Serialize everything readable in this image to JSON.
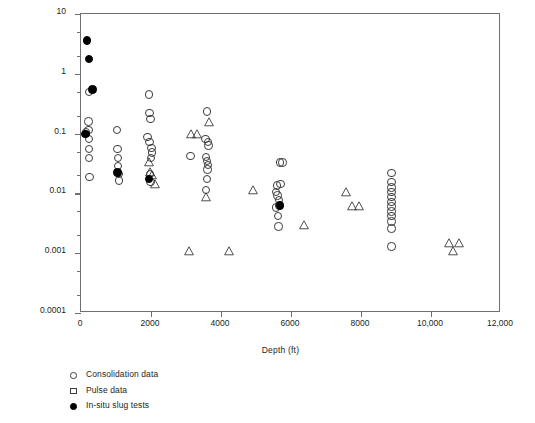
{
  "chart_data": {
    "type": "scatter",
    "title": "",
    "xlabel": "Depth (ft)",
    "ylabel": "Permeability (md)",
    "xlim": [
      0,
      12000
    ],
    "ylim": [
      0.0001,
      10
    ],
    "yscale": "log",
    "xscale": "linear",
    "grid": false,
    "legend_position": "below-left",
    "xticks": [
      0,
      2000,
      4000,
      6000,
      8000,
      10000,
      12000
    ],
    "xticklabels": [
      "0",
      "2000",
      "4000",
      "6000",
      "8000",
      "10,000",
      "12,000"
    ],
    "yticks": [
      0.0001,
      0.001,
      0.01,
      0.1,
      1,
      10
    ],
    "yticklabels": [
      "0.0001",
      "0.001",
      "0.01",
      "0.1",
      "1",
      "10"
    ],
    "series": [
      {
        "name": "Consolidation data",
        "marker": "circle-open",
        "points": [
          [
            230,
            0.5
          ],
          [
            150,
            0.105
          ],
          [
            210,
            0.16
          ],
          [
            215,
            0.115
          ],
          [
            225,
            0.082
          ],
          [
            230,
            0.055
          ],
          [
            235,
            0.039
          ],
          [
            245,
            0.019
          ],
          [
            1030,
            0.115
          ],
          [
            1040,
            0.055
          ],
          [
            1050,
            0.039
          ],
          [
            1060,
            0.029
          ],
          [
            1080,
            0.021
          ],
          [
            1080,
            0.0165
          ],
          [
            1950,
            0.45
          ],
          [
            1960,
            0.22
          ],
          [
            1990,
            0.175
          ],
          [
            1900,
            0.088
          ],
          [
            1960,
            0.072
          ],
          [
            2010,
            0.057
          ],
          [
            2030,
            0.048
          ],
          [
            2000,
            0.039
          ],
          [
            1980,
            0.021
          ],
          [
            1985,
            0.0155
          ],
          [
            3600,
            0.235
          ],
          [
            3560,
            0.082
          ],
          [
            3620,
            0.072
          ],
          [
            3640,
            0.063
          ],
          [
            3130,
            0.042
          ],
          [
            3570,
            0.041
          ],
          [
            3600,
            0.035
          ],
          [
            3630,
            0.03
          ],
          [
            3610,
            0.025
          ],
          [
            3600,
            0.0175
          ],
          [
            3580,
            0.0115
          ],
          [
            5680,
            0.033
          ],
          [
            5760,
            0.033
          ],
          [
            5600,
            0.0135
          ],
          [
            5700,
            0.0145
          ],
          [
            5580,
            0.0105
          ],
          [
            5610,
            0.0092
          ],
          [
            5650,
            0.0078
          ],
          [
            5660,
            0.0063
          ],
          [
            5580,
            0.0058
          ],
          [
            5620,
            0.0042
          ],
          [
            5640,
            0.0028
          ],
          [
            8870,
            0.022
          ],
          [
            8870,
            0.0155
          ],
          [
            8870,
            0.0125
          ],
          [
            8870,
            0.0105
          ],
          [
            8870,
            0.0088
          ],
          [
            8870,
            0.0072
          ],
          [
            8870,
            0.006
          ],
          [
            8870,
            0.005
          ],
          [
            8870,
            0.0042
          ],
          [
            8870,
            0.0034
          ],
          [
            8870,
            0.0026
          ],
          [
            8870,
            0.0013
          ]
        ]
      },
      {
        "name": "Pulse data",
        "marker": "triangle-open",
        "points": [
          [
            1930,
            0.033
          ],
          [
            1960,
            0.0225
          ],
          [
            2020,
            0.0205
          ],
          [
            2110,
            0.0145
          ],
          [
            3080,
            0.0011
          ],
          [
            3150,
            0.098
          ],
          [
            3300,
            0.098
          ],
          [
            3670,
            0.155
          ],
          [
            3560,
            0.0088
          ],
          [
            4230,
            0.0011
          ],
          [
            4900,
            0.0115
          ],
          [
            6370,
            0.003
          ],
          [
            7570,
            0.0105
          ],
          [
            7730,
            0.0062
          ],
          [
            7940,
            0.0062
          ],
          [
            10520,
            0.0015
          ],
          [
            10800,
            0.0015
          ],
          [
            10620,
            0.0011
          ]
        ]
      },
      {
        "name": "In-situ slug tests",
        "marker": "circle-filled",
        "points": [
          [
            180,
            3.6
          ],
          [
            230,
            1.75
          ],
          [
            330,
            0.55
          ],
          [
            130,
            0.098
          ],
          [
            1040,
            0.0225
          ],
          [
            1950,
            0.0175
          ],
          [
            5680,
            0.0063
          ]
        ]
      }
    ]
  },
  "legend": {
    "items": [
      {
        "label": "Consolidation data",
        "swatch": "circle-open-icon"
      },
      {
        "label": "Pulse data",
        "swatch": "square-open-icon"
      },
      {
        "label": "In-situ slug tests",
        "swatch": "circle-filled-icon"
      }
    ]
  },
  "colors": {
    "axis": "#6f6f6f",
    "marker_outline": "#3b3b3b",
    "marker_fill": "#000000",
    "text": "#231f20",
    "background": "#ffffff"
  }
}
